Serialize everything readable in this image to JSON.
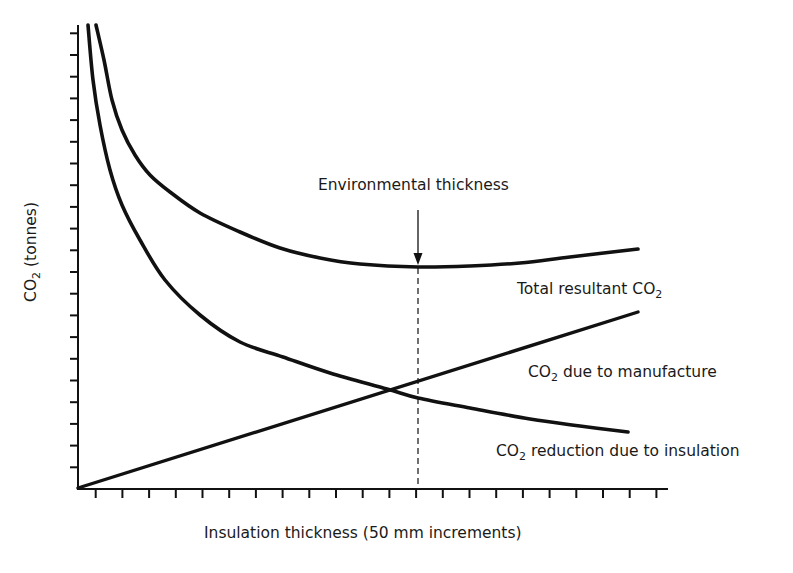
{
  "chart_data": {
    "type": "line",
    "title": "",
    "xlabel": "Insulation thickness (50 mm increments)",
    "ylabel": "CO2 (tonnes)",
    "ylabel_parts": {
      "pre": "CO",
      "sub": "2",
      "post": " (tonnes)"
    },
    "x_ticks_count": 22,
    "y_ticks_count": 21,
    "x_tick_labels": [],
    "y_tick_labels": [],
    "grid": false,
    "legend": "none (direct curve labels)",
    "x_range": [
      0,
      22
    ],
    "y_range": [
      0,
      21
    ],
    "series": [
      {
        "name": "Total resultant CO2",
        "label_parts": {
          "pre": "Total resultant CO",
          "sub": "2",
          "post": ""
        },
        "points_px": [
          [
            96,
            25
          ],
          [
            104,
            60
          ],
          [
            112,
            100
          ],
          [
            122,
            130
          ],
          [
            135,
            155
          ],
          [
            150,
            175
          ],
          [
            170,
            192
          ],
          [
            200,
            213
          ],
          [
            240,
            232
          ],
          [
            280,
            248
          ],
          [
            320,
            258
          ],
          [
            360,
            264
          ],
          [
            418,
            267
          ],
          [
            470,
            266
          ],
          [
            520,
            263
          ],
          [
            570,
            257
          ],
          [
            638,
            249
          ]
        ],
        "x": [
          0.7,
          2,
          4,
          6,
          8,
          10,
          12,
          13,
          16,
          18,
          20.8
        ],
        "y": [
          21,
          15.4,
          12.8,
          11.7,
          10.9,
          10.5,
          10.2,
          10.2,
          10.3,
          10.6,
          11.0
        ]
      },
      {
        "name": "CO2 due to manufacture",
        "label_parts": {
          "pre": "CO",
          "sub": "2",
          "post": " due to manufacture"
        },
        "points_px": [
          [
            78,
            488
          ],
          [
            638,
            312
          ]
        ],
        "x": [
          0,
          20.8
        ],
        "y": [
          0,
          8.1
        ]
      },
      {
        "name": "CO2 reduction due to insulation",
        "label_parts": {
          "pre": "CO",
          "sub": "2",
          "post": " reduction due to insulation"
        },
        "points_px": [
          [
            88,
            25
          ],
          [
            93,
            80
          ],
          [
            100,
            125
          ],
          [
            110,
            170
          ],
          [
            122,
            205
          ],
          [
            140,
            240
          ],
          [
            165,
            280
          ],
          [
            200,
            315
          ],
          [
            240,
            342
          ],
          [
            283,
            357
          ],
          [
            330,
            373
          ],
          [
            387,
            389
          ],
          [
            418,
            398
          ],
          [
            470,
            408
          ],
          [
            530,
            419
          ],
          [
            580,
            426
          ],
          [
            628,
            432
          ]
        ],
        "x": [
          0.4,
          2,
          4,
          6,
          8,
          11.5,
          13,
          16,
          20.4
        ],
        "y": [
          21,
          11.5,
          8.2,
          6.2,
          5.1,
          4.6,
          4.1,
          3.3,
          2.6
        ]
      }
    ],
    "annotations": [
      {
        "text": "Environmental thickness",
        "type": "arrow+dashed-vline",
        "x": 13,
        "note": "minimum of total resultant CO2"
      }
    ]
  },
  "labels": {
    "env_thickness": "Environmental thickness",
    "xlabel": "Insulation thickness (50 mm increments)",
    "total": {
      "pre": "Total resultant CO",
      "sub": "2"
    },
    "manufacture": {
      "pre": "CO",
      "sub": "2",
      "post": " due to manufacture"
    },
    "reduction": {
      "pre": "CO",
      "sub": "2",
      "post": " reduction due to insulation"
    },
    "ylabel": {
      "pre": "CO",
      "sub": "2",
      "post": " (tonnes)"
    }
  },
  "colors": {
    "ink": "#111111",
    "background": "#ffffff"
  }
}
